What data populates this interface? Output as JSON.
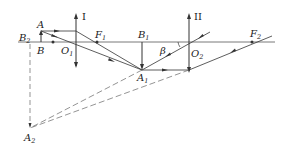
{
  "diagram": {
    "type": "two-lens optical ray diagram",
    "colors": {
      "line": "#333333",
      "dashed": "#555555",
      "background": "#ffffff"
    },
    "labels": {
      "lens1": "I",
      "lens2": "II",
      "A": "A",
      "B": "B",
      "B2": "B",
      "B2_sub": "2",
      "O1": "O",
      "O1_sub": "1",
      "F1": "F",
      "F1_sub": "1",
      "B1": "B",
      "B1_sub": "1",
      "A1": "A",
      "A1_sub": "1",
      "beta": "β",
      "O2": "O",
      "O2_sub": "2",
      "F2": "F",
      "F2_sub": "2",
      "A2": "A",
      "A2_sub": "2"
    },
    "elements": [
      "principal axis",
      "converging lens I (arrows up/down) at O1",
      "converging lens II at O2",
      "object AB",
      "real intermediate image A1B1",
      "virtual final image A2B2 (dashed)",
      "angle beta at O2"
    ]
  }
}
